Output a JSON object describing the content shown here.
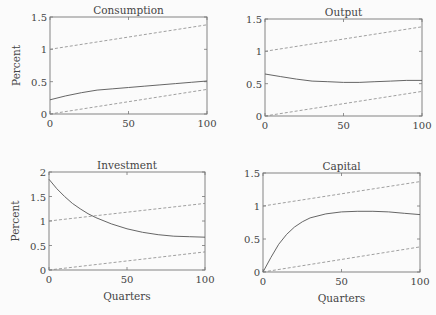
{
  "figure": {
    "y_label": "Percent",
    "x_label": "Quarters"
  },
  "chart_data": [
    {
      "type": "line",
      "title": "Consumption",
      "xlabel": "",
      "ylabel": "Percent",
      "xlim": [
        0,
        100
      ],
      "ylim": [
        0,
        1.5
      ],
      "xticks": [
        "0",
        "50",
        "100"
      ],
      "yticks": [
        "0",
        "0.5",
        "1",
        "1.5"
      ],
      "grid": false,
      "series": [
        {
          "name": "response",
          "style": "solid",
          "x": [
            0,
            10,
            20,
            30,
            40,
            50,
            60,
            70,
            80,
            90,
            100
          ],
          "values": [
            0.22,
            0.28,
            0.33,
            0.37,
            0.39,
            0.41,
            0.43,
            0.45,
            0.47,
            0.49,
            0.51
          ]
        },
        {
          "name": "upper band",
          "style": "dashed",
          "x": [
            0,
            100
          ],
          "values": [
            1.0,
            1.38
          ]
        },
        {
          "name": "lower band",
          "style": "dashed",
          "x": [
            0,
            100
          ],
          "values": [
            0.0,
            0.38
          ]
        }
      ]
    },
    {
      "type": "line",
      "title": "Output",
      "xlabel": "",
      "ylabel": "",
      "xlim": [
        0,
        100
      ],
      "ylim": [
        0,
        1.5
      ],
      "xticks": [
        "0",
        "50",
        "100"
      ],
      "yticks": [
        "0",
        "0.5",
        "1",
        "1.5"
      ],
      "grid": false,
      "series": [
        {
          "name": "response",
          "style": "solid",
          "x": [
            0,
            10,
            20,
            30,
            40,
            50,
            60,
            70,
            80,
            90,
            100
          ],
          "values": [
            0.65,
            0.61,
            0.57,
            0.54,
            0.53,
            0.52,
            0.52,
            0.53,
            0.54,
            0.55,
            0.55
          ]
        },
        {
          "name": "upper band",
          "style": "dashed",
          "x": [
            0,
            100
          ],
          "values": [
            1.0,
            1.38
          ]
        },
        {
          "name": "lower band",
          "style": "dashed",
          "x": [
            0,
            100
          ],
          "values": [
            0.0,
            0.38
          ]
        }
      ]
    },
    {
      "type": "line",
      "title": "Investment",
      "xlabel": "Quarters",
      "ylabel": "Percent",
      "xlim": [
        0,
        100
      ],
      "ylim": [
        0,
        2
      ],
      "xticks": [
        "0",
        "50",
        "100"
      ],
      "yticks": [
        "0",
        "0.5",
        "1",
        "1.5",
        "2"
      ],
      "grid": false,
      "series": [
        {
          "name": "response",
          "style": "solid",
          "x": [
            0,
            5,
            10,
            15,
            20,
            25,
            30,
            40,
            50,
            60,
            70,
            80,
            90,
            100
          ],
          "values": [
            1.85,
            1.66,
            1.5,
            1.36,
            1.25,
            1.15,
            1.07,
            0.94,
            0.84,
            0.77,
            0.72,
            0.69,
            0.68,
            0.67
          ]
        },
        {
          "name": "upper band",
          "style": "dashed",
          "x": [
            0,
            100
          ],
          "values": [
            1.0,
            1.36
          ]
        },
        {
          "name": "lower band",
          "style": "dashed",
          "x": [
            0,
            100
          ],
          "values": [
            0.0,
            0.37
          ]
        }
      ]
    },
    {
      "type": "line",
      "title": "Capital",
      "xlabel": "Quarters",
      "ylabel": "",
      "xlim": [
        0,
        100
      ],
      "ylim": [
        0,
        1.5
      ],
      "xticks": [
        "0",
        "50",
        "100"
      ],
      "yticks": [
        "0",
        "0.5",
        "1",
        "1.5"
      ],
      "grid": false,
      "series": [
        {
          "name": "response",
          "style": "solid",
          "x": [
            0,
            5,
            10,
            15,
            20,
            25,
            30,
            40,
            50,
            60,
            70,
            80,
            90,
            100
          ],
          "values": [
            0.0,
            0.22,
            0.42,
            0.57,
            0.68,
            0.76,
            0.82,
            0.88,
            0.91,
            0.92,
            0.92,
            0.91,
            0.89,
            0.87
          ]
        },
        {
          "name": "upper band",
          "style": "dashed",
          "x": [
            0,
            100
          ],
          "values": [
            1.0,
            1.37
          ]
        },
        {
          "name": "lower band",
          "style": "dashed",
          "x": [
            0,
            100
          ],
          "values": [
            0.0,
            0.38
          ]
        }
      ]
    }
  ],
  "panels_layout": [
    {
      "left": 50,
      "top": 17,
      "right": 207,
      "bottom": 114
    },
    {
      "left": 265,
      "top": 19,
      "right": 422,
      "bottom": 116
    },
    {
      "left": 49,
      "top": 172,
      "right": 205,
      "bottom": 270
    },
    {
      "left": 263,
      "top": 173,
      "right": 420,
      "bottom": 272
    }
  ]
}
